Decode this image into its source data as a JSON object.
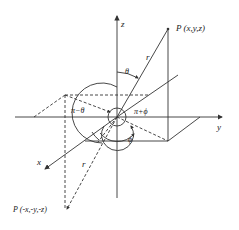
{
  "diagram": {
    "axes": {
      "x": "x",
      "y": "y",
      "z": "z"
    },
    "points": {
      "P": "P (x,y,z)",
      "P_prime": "P (-x,-y,-z)"
    },
    "labels": {
      "r_upper": "r",
      "r_lower": "r",
      "theta": "θ",
      "pi_minus_theta": "π−θ",
      "pi_plus_phi": "π+ϕ",
      "phi": "ϕ"
    },
    "colors": {
      "stroke": "#333333",
      "background": "#ffffff"
    }
  }
}
